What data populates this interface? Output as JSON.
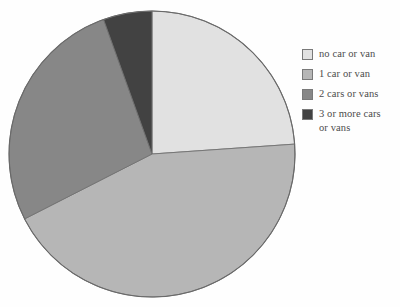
{
  "figure": {
    "type": "pie-chart-figure",
    "background_color": "#ffffff",
    "title": "",
    "subtitle": ""
  },
  "pie": {
    "center_x": 152,
    "center_y": 154,
    "radius": 143,
    "start_angle_deg": 0,
    "direction": "clockwise",
    "outline_color": "#4a4a4a"
  },
  "legend": {
    "position": "right",
    "items": [
      {
        "label": "no car or van",
        "color": "#dcdcdc"
      },
      {
        "label": "1 car or van",
        "color": "#a8a8a8"
      },
      {
        "label": "2 cars or vans",
        "color": "#6e6e6e"
      },
      {
        "label": "3 or more cars\nor vans",
        "color": "#1a1a1a"
      }
    ]
  },
  "chart_data": {
    "type": "pie",
    "title": "",
    "xlabel": "",
    "ylabel": "",
    "categories": [
      "no car or van",
      "1 car or van",
      "2 cars or vans",
      "3 or more cars or vans"
    ],
    "values": [
      23.9,
      43.6,
      27.0,
      5.5
    ],
    "value_unit": "percent",
    "angles_deg": [
      86,
      157,
      97,
      20
    ],
    "colors": [
      "#dcdcdc",
      "#a8a8a8",
      "#6e6e6e",
      "#1a1a1a"
    ],
    "start_angle_deg": 0,
    "direction": "clockwise",
    "grid": false,
    "legend": true,
    "legend_position": "right",
    "labels_on_slices": false,
    "annotations": []
  }
}
